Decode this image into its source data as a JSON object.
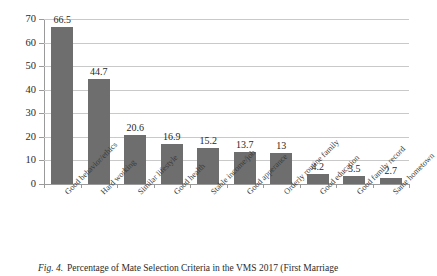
{
  "figure": {
    "caption_lead": "Fig. 4.",
    "caption_text": "Percentage of Mate Selection Criteria in the VMS 2017 (First Marriage"
  },
  "chart_data": {
    "type": "bar",
    "title": "",
    "xlabel": "",
    "ylabel": "",
    "ylim": [
      0,
      70
    ],
    "ytick_step": 10,
    "yticks": [
      "0",
      "10",
      "20",
      "30",
      "40",
      "50",
      "60",
      "70"
    ],
    "grid": true,
    "legend": "none",
    "bar_color": "#6e6e6e",
    "categories": [
      "Good behavior/ethics",
      "Hard working",
      "Similar lifestyle",
      "Good health",
      "Stable income/job",
      "Good apperance",
      "Orderly routine family",
      "Good education",
      "Good family record",
      "Same hometown"
    ],
    "values": [
      66.5,
      44.7,
      20.6,
      16.9,
      15.2,
      13.7,
      13,
      4.2,
      3.5,
      2.7
    ],
    "value_labels": [
      "66.5",
      "44.7",
      "20.6",
      "16.9",
      "15.2",
      "13.7",
      "13",
      "4.2",
      "3.5",
      "2.7"
    ]
  }
}
